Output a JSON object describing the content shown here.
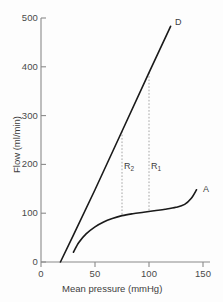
{
  "chart_data": {
    "type": "line",
    "title": "",
    "xlabel": "Mean pressure (mmHg)",
    "ylabel": "Flow (ml/min)",
    "xlim": [
      0,
      155
    ],
    "ylim": [
      0,
      520
    ],
    "xticks": [
      0,
      50,
      100,
      150
    ],
    "yticks": [
      0,
      100,
      200,
      300,
      400,
      500
    ],
    "grid": false,
    "legend": "none",
    "series": [
      {
        "name": "D",
        "label": "D",
        "style": "straight-line",
        "x": [
          18,
          30,
          50,
          75,
          100,
          120
        ],
        "values": [
          0,
          55,
          148,
          268,
          388,
          483
        ]
      },
      {
        "name": "A",
        "label": "A",
        "style": "curve",
        "x": [
          30,
          35,
          42,
          50,
          58,
          66,
          75,
          85,
          95,
          105,
          115,
          125,
          133,
          139,
          144
        ],
        "values": [
          20,
          40,
          58,
          72,
          82,
          89,
          95,
          99,
          102,
          105,
          108,
          112,
          118,
          130,
          148
        ]
      }
    ],
    "annotations": [
      {
        "name": "R2",
        "label": "R",
        "subscript": "2",
        "x": 75,
        "y_from": 95,
        "y_to": 268
      },
      {
        "name": "R1",
        "label": "R",
        "subscript": "1",
        "x": 100,
        "y_from": 104,
        "y_to": 388
      }
    ]
  },
  "axes": {
    "y_tick_labels": [
      "500",
      "400",
      "300",
      "200",
      "100",
      "0"
    ],
    "x_tick_labels": [
      "0",
      "50",
      "100",
      "150"
    ],
    "y_title": "Flow (ml/min)",
    "x_title": "Mean pressure (mmHg)"
  },
  "labels": {
    "curve_d": "D",
    "curve_a": "A",
    "region_2_base": "R",
    "region_2_sub": "2",
    "region_1_base": "R",
    "region_1_sub": "1"
  },
  "colors": {
    "curve": "#1a1a1a",
    "axis": "#8a8a8a",
    "dashed": "#9b9b9b",
    "text": "#3d3d3d",
    "background": "#fdfdfd"
  },
  "caption_fragment": ""
}
